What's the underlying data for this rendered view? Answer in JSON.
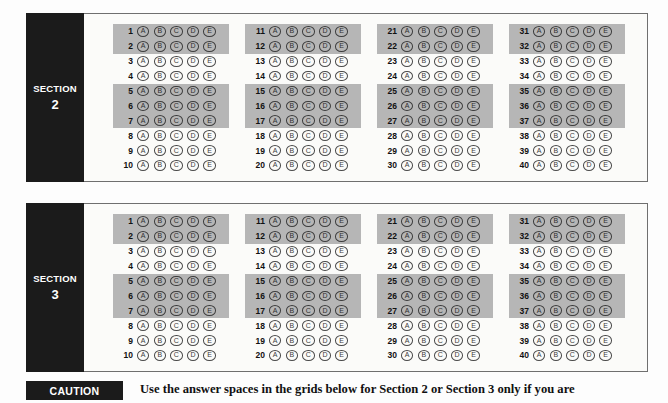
{
  "document": {
    "type": "answer-sheet",
    "letters": [
      "A",
      "B",
      "C",
      "D",
      "E"
    ]
  },
  "sections": [
    {
      "tab_word": "SECTION",
      "tab_number": "2",
      "columns": [
        {
          "rows": [
            {
              "number": "1",
              "shaded": true
            },
            {
              "number": "2",
              "shaded": true
            },
            {
              "number": "3",
              "shaded": false
            },
            {
              "number": "4",
              "shaded": false
            },
            {
              "number": "5",
              "shaded": true
            },
            {
              "number": "6",
              "shaded": true
            },
            {
              "number": "7",
              "shaded": true
            },
            {
              "number": "8",
              "shaded": false
            },
            {
              "number": "9",
              "shaded": false
            },
            {
              "number": "10",
              "shaded": false
            }
          ]
        },
        {
          "rows": [
            {
              "number": "11",
              "shaded": true
            },
            {
              "number": "12",
              "shaded": true
            },
            {
              "number": "13",
              "shaded": false
            },
            {
              "number": "14",
              "shaded": false
            },
            {
              "number": "15",
              "shaded": true
            },
            {
              "number": "16",
              "shaded": true
            },
            {
              "number": "17",
              "shaded": true
            },
            {
              "number": "18",
              "shaded": false
            },
            {
              "number": "19",
              "shaded": false
            },
            {
              "number": "20",
              "shaded": false
            }
          ]
        },
        {
          "rows": [
            {
              "number": "21",
              "shaded": true
            },
            {
              "number": "22",
              "shaded": true
            },
            {
              "number": "23",
              "shaded": false
            },
            {
              "number": "24",
              "shaded": false
            },
            {
              "number": "25",
              "shaded": true
            },
            {
              "number": "26",
              "shaded": true
            },
            {
              "number": "27",
              "shaded": true
            },
            {
              "number": "28",
              "shaded": false
            },
            {
              "number": "29",
              "shaded": false
            },
            {
              "number": "30",
              "shaded": false
            }
          ]
        },
        {
          "rows": [
            {
              "number": "31",
              "shaded": true
            },
            {
              "number": "32",
              "shaded": true
            },
            {
              "number": "33",
              "shaded": false
            },
            {
              "number": "34",
              "shaded": false
            },
            {
              "number": "35",
              "shaded": true
            },
            {
              "number": "36",
              "shaded": true
            },
            {
              "number": "37",
              "shaded": true
            },
            {
              "number": "38",
              "shaded": false
            },
            {
              "number": "39",
              "shaded": false
            },
            {
              "number": "40",
              "shaded": false
            }
          ]
        }
      ]
    },
    {
      "tab_word": "SECTION",
      "tab_number": "3",
      "columns": [
        {
          "rows": [
            {
              "number": "1",
              "shaded": true
            },
            {
              "number": "2",
              "shaded": true
            },
            {
              "number": "3",
              "shaded": false
            },
            {
              "number": "4",
              "shaded": false
            },
            {
              "number": "5",
              "shaded": true
            },
            {
              "number": "6",
              "shaded": true
            },
            {
              "number": "7",
              "shaded": true
            },
            {
              "number": "8",
              "shaded": false
            },
            {
              "number": "9",
              "shaded": false
            },
            {
              "number": "10",
              "shaded": false
            }
          ]
        },
        {
          "rows": [
            {
              "number": "11",
              "shaded": true
            },
            {
              "number": "12",
              "shaded": true
            },
            {
              "number": "13",
              "shaded": false
            },
            {
              "number": "14",
              "shaded": false
            },
            {
              "number": "15",
              "shaded": true
            },
            {
              "number": "16",
              "shaded": true
            },
            {
              "number": "17",
              "shaded": true
            },
            {
              "number": "18",
              "shaded": false
            },
            {
              "number": "19",
              "shaded": false
            },
            {
              "number": "20",
              "shaded": false
            }
          ]
        },
        {
          "rows": [
            {
              "number": "21",
              "shaded": true
            },
            {
              "number": "22",
              "shaded": true
            },
            {
              "number": "23",
              "shaded": false
            },
            {
              "number": "24",
              "shaded": false
            },
            {
              "number": "25",
              "shaded": true
            },
            {
              "number": "26",
              "shaded": true
            },
            {
              "number": "27",
              "shaded": true
            },
            {
              "number": "28",
              "shaded": false
            },
            {
              "number": "29",
              "shaded": false
            },
            {
              "number": "30",
              "shaded": false
            }
          ]
        },
        {
          "rows": [
            {
              "number": "31",
              "shaded": true
            },
            {
              "number": "32",
              "shaded": true
            },
            {
              "number": "33",
              "shaded": false
            },
            {
              "number": "34",
              "shaded": false
            },
            {
              "number": "35",
              "shaded": true
            },
            {
              "number": "36",
              "shaded": true
            },
            {
              "number": "37",
              "shaded": true
            },
            {
              "number": "38",
              "shaded": false
            },
            {
              "number": "39",
              "shaded": false
            },
            {
              "number": "40",
              "shaded": false
            }
          ]
        }
      ]
    }
  ],
  "caution": {
    "badge": "CAUTION",
    "text": "Use the answer spaces in the grids below for Section 2 or Section 3 only if you are"
  },
  "colors": {
    "tab_background": "#1b1b1b",
    "tab_text": "#ffffff",
    "row_shade": "#b6b6b6",
    "panel_background": "#f7f7f5",
    "panel_border": "#6f6f6f",
    "bubble_border": "#4a4a4a",
    "page_background": "#fdfdfd"
  }
}
